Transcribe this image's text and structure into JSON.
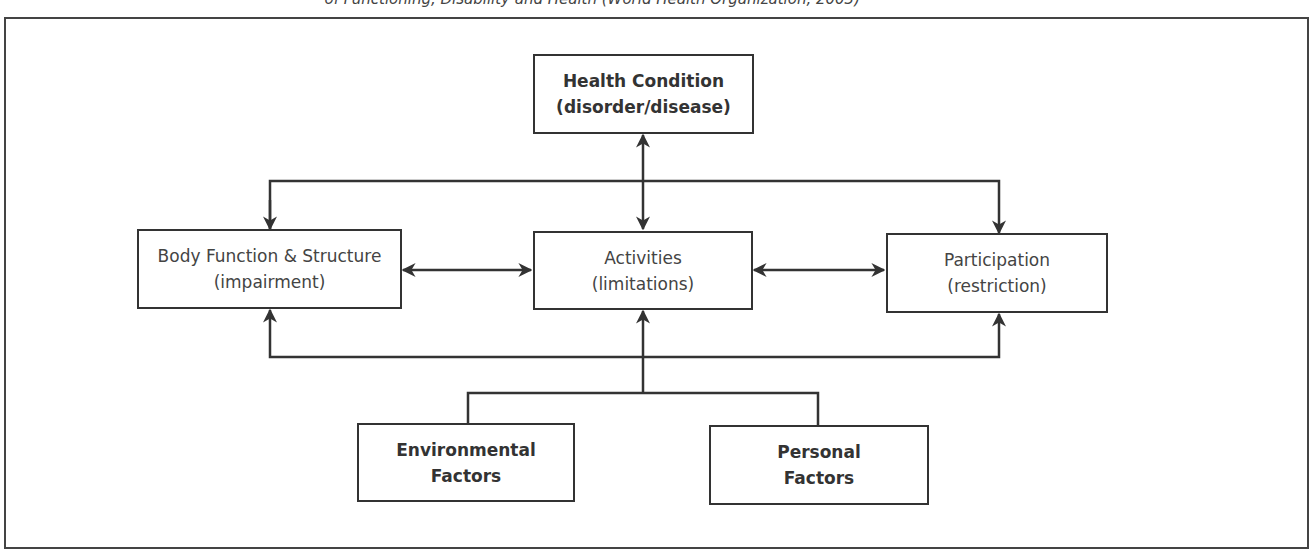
{
  "caption": "of Functioning, Disability and Health (World Health Organization, 2003)",
  "nodes": {
    "health": {
      "line1": "Health Condition",
      "line2": "(disorder/disease)"
    },
    "body": {
      "line1": "Body Function & Structure",
      "line2": "(impairment)"
    },
    "activities": {
      "line1": "Activities",
      "line2": "(limitations)"
    },
    "participation": {
      "line1": "Participation",
      "line2": "(restriction)"
    },
    "environmental": {
      "line1": "Environmental",
      "line2": "Factors"
    },
    "personal": {
      "line1": "Personal",
      "line2": "Factors"
    }
  },
  "colors": {
    "stroke": "#333333",
    "background": "#ffffff"
  }
}
